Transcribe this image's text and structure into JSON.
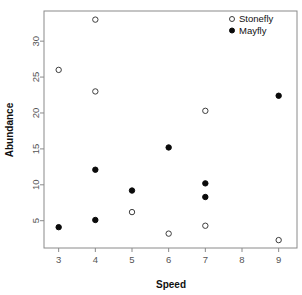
{
  "chart_data": {
    "type": "scatter",
    "title": "",
    "xlabel": "Speed",
    "ylabel": "Abundance",
    "xlim": [
      2.6,
      9.5
    ],
    "ylim": [
      1.2,
      34.2
    ],
    "xticks": [
      3,
      4,
      5,
      6,
      7,
      8,
      9
    ],
    "xtick_labels": [
      "3",
      "4",
      "5",
      "6",
      "7",
      "8",
      "9"
    ],
    "yticks": [
      5,
      10,
      15,
      20,
      25,
      30
    ],
    "ytick_labels": [
      "5",
      "10",
      "15",
      "20",
      "25",
      "30"
    ],
    "grid": false,
    "legend_position": "top-right",
    "series": [
      {
        "name": "Stonefly",
        "marker": "open-circle",
        "color": "#3d3d3d",
        "points": [
          {
            "x": 3,
            "y": 26
          },
          {
            "x": 4,
            "y": 33
          },
          {
            "x": 4,
            "y": 23
          },
          {
            "x": 5,
            "y": 6.2
          },
          {
            "x": 6,
            "y": 3.2
          },
          {
            "x": 7,
            "y": 20.3
          },
          {
            "x": 7,
            "y": 4.3
          },
          {
            "x": 9,
            "y": 2.3
          }
        ]
      },
      {
        "name": "Mayfly",
        "marker": "filled-circle",
        "color": "#0a0a0a",
        "points": [
          {
            "x": 3,
            "y": 4.1
          },
          {
            "x": 4,
            "y": 12.1
          },
          {
            "x": 4,
            "y": 5.1
          },
          {
            "x": 5,
            "y": 9.2
          },
          {
            "x": 6,
            "y": 15.2
          },
          {
            "x": 7,
            "y": 10.2
          },
          {
            "x": 7,
            "y": 8.3
          },
          {
            "x": 9,
            "y": 22.4
          }
        ]
      }
    ]
  },
  "legend": {
    "entries": [
      {
        "label": "Stonefly",
        "marker": "open-circle"
      },
      {
        "label": "Mayfly",
        "marker": "filled-circle"
      }
    ]
  },
  "axes": {
    "x_title": "Speed",
    "y_title": "Abundance"
  }
}
